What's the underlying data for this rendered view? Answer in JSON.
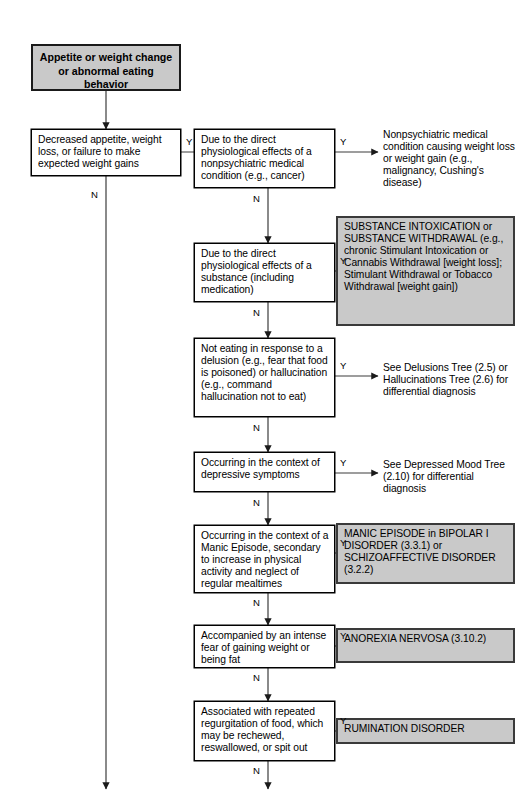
{
  "diagram": {
    "colors": {
      "shaded_fill": "#c9c9c9",
      "box_border": "#000000",
      "outcome_border": "#3a3a3a",
      "line": "#3c3c3c",
      "background": "#ffffff"
    },
    "start": {
      "label": "Appetite or weight change or abnormal eating behavior"
    },
    "labels": {
      "yes": "Y",
      "no": "N"
    },
    "criteria": [
      {
        "id": "c1",
        "label": "Decreased appetite, weight loss, or failure to make expected weight gains"
      },
      {
        "id": "c2",
        "label": "Due to the direct physiological effects of a nonpsychiatric medical condition (e.g., cancer)"
      },
      {
        "id": "c3",
        "label": "Due to the direct physiological effects of a substance (including medication)"
      },
      {
        "id": "c4",
        "label": "Not eating in response to a delusion (e.g., fear that food is poisoned) or hallucination (e.g., command hallucination not to eat)"
      },
      {
        "id": "c5",
        "label": "Occurring in the context of depressive symptoms"
      },
      {
        "id": "c6",
        "label": "Occurring in the context of a Manic Episode, secondary to increase in physical activity and neglect of regular mealtimes"
      },
      {
        "id": "c7",
        "label": "Accompanied by an intense fear of gaining weight or being fat"
      },
      {
        "id": "c8",
        "label": "Associated with repeated regurgitation of food, which may be rechewed, reswallowed, or spit out"
      }
    ],
    "outcomes": [
      {
        "id": "o1",
        "style": "plain",
        "label": "Nonpsychiatric medical condition causing weight loss or weight gain (e.g., malignancy, Cushing's disease)"
      },
      {
        "id": "o2",
        "style": "shaded",
        "label": "SUBSTANCE INTOXICATION or SUBSTANCE WITHDRAWAL (e.g., chronic Stimulant Intoxication or Cannabis Withdrawal [weight loss]; Stimulant Withdrawal or Tobacco Withdrawal [weight gain])"
      },
      {
        "id": "o3",
        "style": "plain",
        "label": "See Delusions Tree (2.5) or Hallucinations Tree (2.6) for differential diagnosis"
      },
      {
        "id": "o4",
        "style": "plain",
        "label": "See Depressed Mood Tree (2.10) for differential diagnosis"
      },
      {
        "id": "o5",
        "style": "shaded",
        "label": "MANIC EPISODE in BIPOLAR I DISORDER (3.3.1) or SCHIZOAFFECTIVE DISORDER (3.2.2)"
      },
      {
        "id": "o6",
        "style": "shaded",
        "label": "ANOREXIA NERVOSA (3.10.2)"
      },
      {
        "id": "o7",
        "style": "shaded",
        "label": "RUMINATION DISORDER"
      }
    ]
  }
}
